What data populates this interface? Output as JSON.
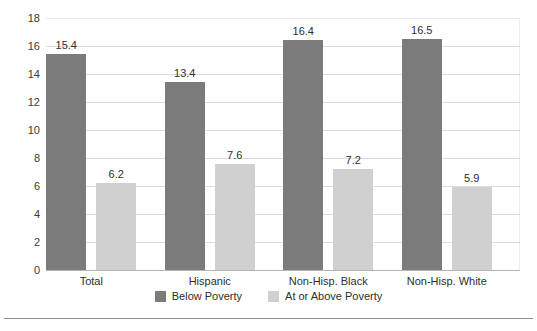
{
  "chart_data": {
    "type": "bar",
    "title": "",
    "subtitle": "",
    "xlabel": "",
    "ylabel": "",
    "grid": true,
    "legend_position": "bottom",
    "ylim": [
      0,
      18
    ],
    "ytick_step": 2,
    "yticks": [
      "18",
      "16",
      "14",
      "12",
      "10",
      "8",
      "6",
      "4",
      "2",
      "0"
    ],
    "categories": [
      "Total",
      "Hispanic",
      "Non-Hisp. Black",
      "Non-Hisp. White"
    ],
    "series": [
      {
        "name": "Below Poverty",
        "color": "#7b7b7b",
        "values": [
          15.4,
          13.4,
          16.4,
          16.5
        ],
        "labels": [
          "15.4",
          "13.4",
          "16.4",
          "16.5"
        ]
      },
      {
        "name": "At or Above Poverty",
        "color": "#d0d0d0",
        "values": [
          6.2,
          7.6,
          7.2,
          5.9
        ],
        "labels": [
          "6.2",
          "7.6",
          "7.2",
          "5.9"
        ]
      }
    ]
  },
  "colors": {
    "below_poverty": "#7b7b7b",
    "at_or_above_poverty": "#d0d0d0",
    "gridline": "#dcdcdc",
    "axis": "#b4b4b4",
    "text": "#2e2e2e",
    "background": "#ffffff"
  }
}
